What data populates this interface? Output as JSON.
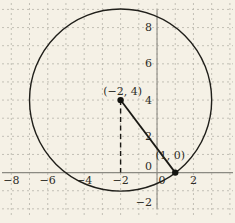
{
  "figure": {
    "width": 235,
    "height": 223,
    "background": "#f5f1e6"
  },
  "chart_data": {
    "type": "scatter",
    "description_of_visible_content": "Circle of radius 5 centered at (-2, 4) on a dashed unit grid; radius segment drawn to point (1, 0); dashed vertical drop from center to x-axis",
    "x_range": [
      -8.62,
      4.28
    ],
    "y_range": [
      -2.78,
      9.52
    ],
    "grid": true,
    "grid_step": 1,
    "x_tick_values": [
      -8,
      -6,
      -4,
      -2,
      0,
      2
    ],
    "x_tick_labels": [
      "−8",
      "−6",
      "−4",
      "−2",
      "0",
      "2"
    ],
    "x_tick_dx": [
      0,
      0,
      0,
      0,
      5,
      0
    ],
    "y_tick_values": [
      -2,
      0,
      2,
      4,
      6,
      8
    ],
    "y_tick_labels": [
      "−2",
      "0",
      "2",
      "4",
      "6",
      "8"
    ],
    "y_tick_dy": [
      -6,
      -6,
      0,
      0,
      0,
      0
    ],
    "axis_extent": {
      "x_axis_x": [
        2,
        233
      ],
      "y_axis_y_units": [
        9.0,
        -2.0
      ]
    },
    "grid_extent": {
      "vertical_y_px": [
        3,
        218
      ],
      "horizontal_x_px": [
        2,
        233
      ]
    },
    "circle": {
      "center": [
        -2,
        4
      ],
      "radius": 5
    },
    "segments": [
      {
        "name": "radius-line",
        "from": [
          -2,
          4
        ],
        "to": [
          1,
          0
        ],
        "style": "solid",
        "width": 1.8
      },
      {
        "name": "dashed-drop-line",
        "from": [
          -2,
          4
        ],
        "to": [
          -2,
          0
        ],
        "style": "dashed",
        "width": 1.4
      }
    ],
    "points": [
      {
        "name": "center-point",
        "x": -2,
        "y": 4,
        "label": "(−2, 4)",
        "label_offset_px": [
          2,
          -9
        ]
      },
      {
        "name": "circle-point",
        "x": 1,
        "y": 0,
        "label": "(1, 0)",
        "label_offset_px": [
          -5,
          -17
        ]
      }
    ],
    "point_radius_px": 3.2,
    "font_size_px": 11,
    "colors": {
      "background": "#f5f1e6",
      "grid": "#b6b4aa",
      "axis": "#8b8a82",
      "curve": "#201f1a",
      "segment": "#1a1914",
      "point": "#141410",
      "text": "#2e2d27"
    }
  }
}
